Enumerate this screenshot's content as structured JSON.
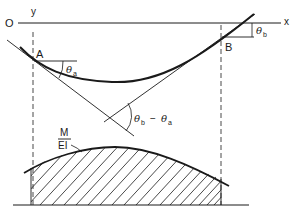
{
  "diagram": {
    "type": "beam-deflection-moment-area",
    "labels": {
      "origin": "O",
      "y_axis": "y",
      "x_axis": "x",
      "point_a": "A",
      "point_b": "B",
      "theta": "θ",
      "sub_a": "a",
      "sub_b": "b",
      "minus": "−",
      "m_over_ei_num": "M",
      "m_over_ei_den": "EI"
    },
    "annotations": [
      {
        "id": "theta_a",
        "text": "θa",
        "description": "slope angle at A"
      },
      {
        "id": "theta_b",
        "text": "θb",
        "description": "slope angle at B"
      },
      {
        "id": "theta_diff",
        "text": "θb − θa",
        "description": "angle between tangents at A and B"
      },
      {
        "id": "m_ei",
        "text": "M/EI",
        "description": "M/EI diagram, hatched area"
      }
    ],
    "colors": {
      "stroke": "#1a1a1a",
      "background": "#ffffff"
    }
  }
}
